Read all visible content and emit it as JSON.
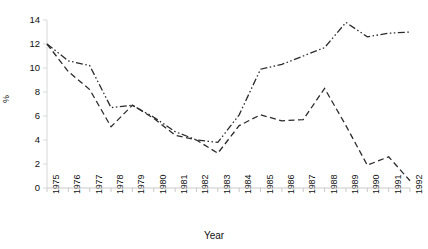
{
  "chart_data": {
    "type": "line",
    "title": "",
    "xlabel": "Year",
    "ylabel": "%",
    "categories": [
      "1975",
      "1976",
      "1977",
      "1978",
      "1979",
      "1980",
      "1981",
      "1982",
      "1983",
      "1984",
      "1985",
      "1986",
      "1987",
      "1988",
      "1989",
      "1990",
      "1991",
      "1992"
    ],
    "ylim": [
      0,
      14
    ],
    "yticks": [
      "0",
      "2",
      "4",
      "6",
      "8",
      "10",
      "12",
      "14"
    ],
    "grid": false,
    "legend": "none",
    "series": [
      {
        "name": "series-dash-dot",
        "style": "dash-dot",
        "values": [
          12.0,
          10.6,
          10.2,
          6.7,
          6.9,
          5.9,
          4.7,
          4.0,
          3.8,
          6.1,
          9.9,
          10.3,
          11.0,
          11.7,
          13.8,
          12.6,
          12.9,
          13.0
        ]
      },
      {
        "name": "series-dashed",
        "style": "dashed",
        "values": [
          12.0,
          9.7,
          8.2,
          5.1,
          6.9,
          5.8,
          4.4,
          4.0,
          2.9,
          5.2,
          6.1,
          5.6,
          5.7,
          8.3,
          5.2,
          1.9,
          2.6,
          0.6
        ]
      }
    ]
  },
  "axis": {
    "y_title": "%",
    "x_title": "Year"
  }
}
